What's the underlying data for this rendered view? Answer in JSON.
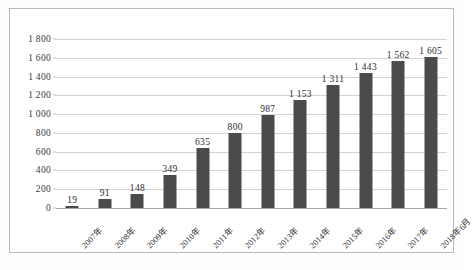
{
  "chart_data": {
    "type": "bar",
    "title": "",
    "subtitle": "",
    "xlabel": "",
    "ylabel": "",
    "ylim": [
      0,
      1800
    ],
    "ytick_step": 200,
    "yticks": [
      "1 800",
      "1 600",
      "1 400",
      "1 200",
      "1 000",
      "800",
      "600",
      "400",
      "200",
      "0"
    ],
    "ytick_values": [
      1800,
      1600,
      1400,
      1200,
      1000,
      800,
      600,
      400,
      200,
      0
    ],
    "grid": true,
    "legend": "none",
    "bar_color": "#4b4b4b",
    "gridline_color": "#d2d2d2",
    "axis_color": "#a8a8a8",
    "frame_color": "#b9b9b9",
    "categories": [
      "2007年",
      "2008年",
      "2009年",
      "2010年",
      "2011年",
      "2012年",
      "2013年",
      "2014年",
      "2015年",
      "2016年",
      "2017年",
      "2018年6月"
    ],
    "values": [
      19,
      91,
      148,
      349,
      635,
      800,
      987,
      1153,
      1311,
      1443,
      1562,
      1605
    ],
    "data_labels": [
      "19",
      "91",
      "148",
      "349",
      "635",
      "800",
      "987",
      "1 153",
      "1 311",
      "1 443",
      "1 562",
      "1 605"
    ]
  }
}
